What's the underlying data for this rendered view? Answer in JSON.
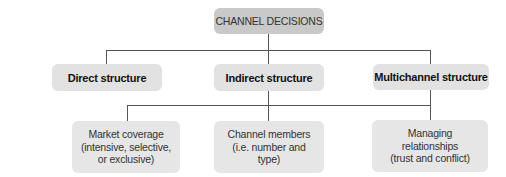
{
  "diagram": {
    "root": {
      "label": "CHANNEL DECISIONS"
    },
    "structures": [
      {
        "label": "Direct structure"
      },
      {
        "label": "Indirect structure"
      },
      {
        "label": "Multichannel structure"
      }
    ],
    "decisions": [
      {
        "label": "Market coverage\n(intensive, selective,\nor exclusive)"
      },
      {
        "label": "Channel members\n(i.e. number and\ntype)"
      },
      {
        "label": "Managing\nrelationships\n(trust and conflict)"
      }
    ],
    "colors": {
      "root_fill": "#c9c9c9",
      "box_fill": "#e2e2e2",
      "connector": "#555555"
    }
  }
}
